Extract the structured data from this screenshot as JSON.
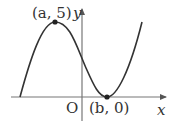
{
  "diagram": {
    "type": "function-graph",
    "axes": {
      "x_label": "x",
      "y_label": "y",
      "origin_label": "O"
    },
    "points": [
      {
        "label": "(a, 5)",
        "role": "local-maximum",
        "x": "a",
        "y": 5
      },
      {
        "label": "(b, 0)",
        "role": "local-minimum",
        "x": "b",
        "y": 0
      }
    ],
    "colors": {
      "curve": "#333333",
      "axes": "#555555",
      "point": "#222222"
    }
  }
}
